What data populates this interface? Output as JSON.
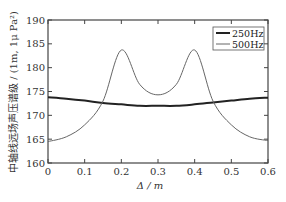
{
  "chart_data": {
    "type": "line",
    "title": "",
    "xlabel": "Δ / m",
    "ylabel": "中轴线远场声压谱级 / (1m, 1μ Pa²)",
    "xlim": [
      0,
      0.6
    ],
    "ylim": [
      160,
      190
    ],
    "xticks": [
      "0",
      "0.1",
      "0.2",
      "0.3",
      "0.4",
      "0.5",
      "0.6"
    ],
    "yticks": [
      "160",
      "165",
      "170",
      "175",
      "180",
      "185",
      "190"
    ],
    "grid": false,
    "legend_position": "upper right",
    "x": [
      0,
      0.05,
      0.1,
      0.15,
      0.2,
      0.25,
      0.3,
      0.35,
      0.4,
      0.45,
      0.5,
      0.55,
      0.6
    ],
    "series": [
      {
        "name": "250Hz",
        "style": "solid-thick",
        "color": "#222222",
        "values": [
          173.8,
          173.5,
          173.1,
          172.6,
          172.3,
          172.0,
          172.0,
          172.0,
          172.3,
          172.7,
          173.1,
          173.5,
          173.7
        ]
      },
      {
        "name": "500Hz",
        "style": "thin",
        "color": "#666666",
        "values": [
          164.5,
          165.5,
          168.0,
          173.0,
          183.7,
          176.5,
          174.3,
          176.5,
          183.7,
          173.0,
          168.0,
          165.5,
          164.7
        ]
      }
    ]
  },
  "legend": {
    "items": [
      {
        "label": "250Hz"
      },
      {
        "label": "500Hz"
      }
    ]
  },
  "axes": {
    "xlabel": "Δ / m",
    "ylabel": "中轴线远场声压谱级 / (1m, 1μ Pa²)"
  }
}
